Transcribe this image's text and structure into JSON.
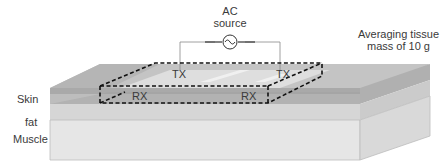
{
  "source": {
    "line1": "AC",
    "line2": "source",
    "symbol": "sine-wave-source"
  },
  "annotation": {
    "line1": "Averaging tissue",
    "line2": "mass of 10 g"
  },
  "layers": {
    "skin": "Skin",
    "fat": "fat",
    "muscle": "Muscle"
  },
  "electrodes": {
    "tx_left": "TX",
    "tx_right": "TX",
    "rx_left": "RX",
    "rx_right": "RX"
  },
  "colors": {
    "muscle_front": "#e4e4e4",
    "muscle_side": "#d6d6d6",
    "fat_front": "#d2d2d2",
    "skin_front": "#a8a8a8",
    "top_surface": "#cfcfcf",
    "dashed_box": "#111111",
    "wire": "#888888"
  }
}
